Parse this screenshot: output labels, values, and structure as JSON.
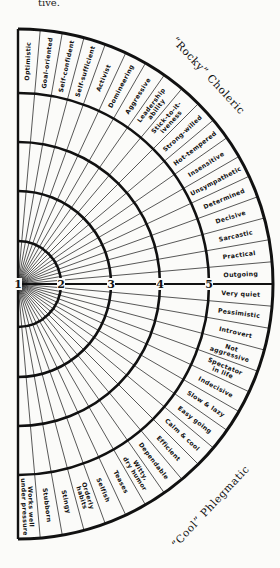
{
  "caption_fragment": "tive.",
  "wheel": {
    "center": [
      18,
      284
    ],
    "rings": [
      {
        "label": "1",
        "radius": 0
      },
      {
        "label": "2",
        "radius": 43
      },
      {
        "label": "3",
        "radius": 93
      },
      {
        "label": "4",
        "radius": 142
      },
      {
        "label": "5",
        "radius": 191
      }
    ],
    "outer_radius": 255,
    "sector_count": 36,
    "colors": {
      "ink": "#111111",
      "paper": "#fbfbf9"
    }
  },
  "groups": {
    "top": {
      "label": "“Rocky” Choleric"
    },
    "bottom": {
      "label": "“Cool” Phlegmatic"
    }
  },
  "traits": {
    "choleric": [
      [
        "Optimistic"
      ],
      [
        "Goal-oriented"
      ],
      [
        "Self-confident"
      ],
      [
        "Self-sufficient"
      ],
      [
        "Activist"
      ],
      [
        "Domineering"
      ],
      [
        "Aggressive"
      ],
      [
        "Leadership",
        "ability"
      ],
      [
        "Stick-to-it-",
        "iveness"
      ],
      [
        "Strong-willed"
      ],
      [
        "Hot-tempered"
      ],
      [
        "Insensitive"
      ],
      [
        "Unsympathetic"
      ],
      [
        "Determined"
      ],
      [
        "Decisive"
      ],
      [
        "Sarcastic"
      ],
      [
        "Practical"
      ],
      [
        "Outgoing"
      ]
    ],
    "phlegmatic": [
      [
        "Very quiet"
      ],
      [
        "Pessimistic"
      ],
      [
        "Introvert"
      ],
      [
        "Not",
        "aggressive"
      ],
      [
        "Spectator",
        "in life"
      ],
      [
        "Indecisive"
      ],
      [
        "Slow & lazy"
      ],
      [
        "Easy going"
      ],
      [
        "Calm & cool"
      ],
      [
        "Efficient"
      ],
      [
        "Dependable"
      ],
      [
        "Witty,",
        "dry humor"
      ],
      [
        "Teases"
      ],
      [
        "Selfish"
      ],
      [
        "Orderly",
        "habits"
      ],
      [
        "Stingy"
      ],
      [
        "Stubborn"
      ],
      [
        "Works well",
        "under pressure"
      ]
    ]
  }
}
